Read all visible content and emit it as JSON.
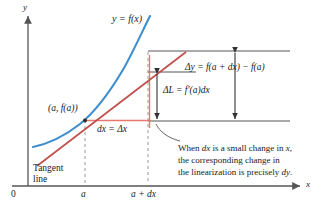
{
  "figure": {
    "kind": "calculus-differentials-diagram",
    "axes": {
      "y_label": "y",
      "x_label": "x",
      "origin_label": "0",
      "x_ticks": [
        "a",
        "a + dx"
      ]
    },
    "labels": {
      "curve": "y = f(x)",
      "point": "(a, f(a))",
      "tangent_line_1": "Tangent",
      "tangent_line_2": "line",
      "dx": "dx = Δx",
      "delta_L": "ΔL = f′(a)dx",
      "delta_y": "Δy = f(a + dx) − f(a)"
    },
    "caption": {
      "line1_a": "When ",
      "line1_b": "dx",
      "line1_c": " is a small change in ",
      "line1_d": "x",
      "line1_e": ",",
      "line2": "the corresponding change in",
      "line3_a": "the linearization is precisely ",
      "line3_b": "dy",
      "line3_c": "."
    },
    "colors": {
      "curve": "#3f8fce",
      "tangent": "#c0504d",
      "guide_red": "#e8776f",
      "axis": "#555555",
      "dashed": "#999999",
      "measure": "#333333",
      "text": "#1a1a1a"
    }
  }
}
